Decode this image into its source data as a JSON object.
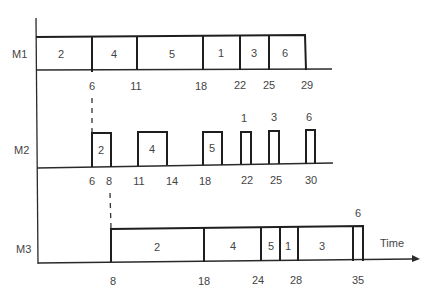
{
  "title": "",
  "machines": [
    {
      "label": "M1"
    },
    {
      "label": "M2"
    },
    {
      "label": "M3"
    }
  ],
  "axis_label": "Time",
  "m1": {
    "jobs": [
      {
        "job": "2",
        "start": 0,
        "end": 6
      },
      {
        "job": "4",
        "start": 6,
        "end": 11
      },
      {
        "job": "5",
        "start": 11,
        "end": 18
      },
      {
        "job": "1",
        "start": 18,
        "end": 22
      },
      {
        "job": "3",
        "start": 22,
        "end": 25
      },
      {
        "job": "6",
        "start": 25,
        "end": 29
      }
    ],
    "ticks": [
      "6",
      "11",
      "18",
      "22",
      "25",
      "29"
    ]
  },
  "m2": {
    "jobs": [
      {
        "job": "2",
        "start": 6,
        "end": 8
      },
      {
        "job": "4",
        "start": 11,
        "end": 14
      },
      {
        "job": "5",
        "start": 18,
        "end": 20
      },
      {
        "job": "1",
        "start": 22,
        "end": 23
      },
      {
        "job": "3",
        "start": 25,
        "end": 26
      },
      {
        "job": "6",
        "start": 29,
        "end": 30
      }
    ],
    "ticks": [
      "6",
      "8",
      "11",
      "14",
      "18",
      "22",
      "25",
      "30"
    ]
  },
  "m3": {
    "jobs": [
      {
        "job": "2",
        "start": 8,
        "end": 18
      },
      {
        "job": "4",
        "start": 18,
        "end": 24
      },
      {
        "job": "5",
        "start": 24,
        "end": 26
      },
      {
        "job": "1",
        "start": 26,
        "end": 28
      },
      {
        "job": "3",
        "start": 28,
        "end": 34
      },
      {
        "job": "6",
        "start": 34,
        "end": 35
      }
    ],
    "ticks": [
      "8",
      "18",
      "24",
      "28",
      "35"
    ]
  }
}
